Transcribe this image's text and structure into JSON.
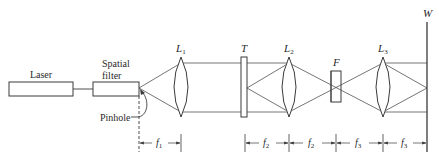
{
  "diagram": {
    "type": "optical-setup",
    "components": {
      "laser": {
        "label": "Laser"
      },
      "spatial_filter": {
        "label_line1": "Spatial",
        "label_line2": "filter"
      },
      "pinhole": {
        "label": "Pinhole"
      },
      "lens1": {
        "label": "L",
        "sub": "1"
      },
      "transparency": {
        "label": "T"
      },
      "lens2": {
        "label": "L",
        "sub": "2"
      },
      "filter": {
        "label": "F"
      },
      "lens3": {
        "label": "L",
        "sub": "3"
      },
      "screen": {
        "label": "W"
      }
    },
    "dimensions": [
      {
        "label": "f",
        "sub": "1"
      },
      {
        "label": "f",
        "sub": "2"
      },
      {
        "label": "f",
        "sub": "2"
      },
      {
        "label": "f",
        "sub": "3"
      },
      {
        "label": "f",
        "sub": "3"
      }
    ],
    "colors": {
      "line": "#3a3a3a",
      "background": "#ffffff"
    }
  }
}
